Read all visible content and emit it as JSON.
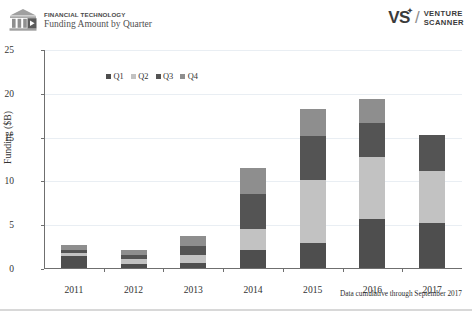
{
  "header": {
    "brand_title": "FINANCIAL TECHNOLOGY",
    "brand_subtitle": "Funding Amount by Quarter",
    "logo_left_icon": "bank-building-icon",
    "logo_right_mark": "VS",
    "logo_right_star": "✦",
    "logo_right_slash": "/",
    "logo_right_line1": "VENTURE",
    "logo_right_line2": "SCANNER"
  },
  "footnote": "Data cumulative through September 2017",
  "colors": {
    "q1": "#4e4e4e",
    "q2": "#c2c2c2",
    "q3": "#545454",
    "q4": "#8e8e8e",
    "axis": "#6f6f6f",
    "grid": "#e9eef3",
    "text": "#333333"
  },
  "chart_data": {
    "type": "bar",
    "stacked": true,
    "title": "Funding Amount by Quarter",
    "subtitle": "FINANCIAL TECHNOLOGY",
    "xlabel": "",
    "ylabel": "Funding ($B)",
    "ylim": [
      0,
      25
    ],
    "yticks": [
      0,
      5,
      10,
      15,
      20,
      25
    ],
    "grid": true,
    "legend_position": "top-left",
    "categories": [
      "2011",
      "2012",
      "2013",
      "2014",
      "2015",
      "2016",
      "2017"
    ],
    "series": [
      {
        "name": "Q1",
        "color": "#4e4e4e",
        "values": [
          1.4,
          0.5,
          0.6,
          2.0,
          2.8,
          5.6,
          5.1
        ]
      },
      {
        "name": "Q2",
        "color": "#c2c2c2",
        "values": [
          0.3,
          0.5,
          0.9,
          2.5,
          7.2,
          7.1,
          6.0
        ]
      },
      {
        "name": "Q3",
        "color": "#545454",
        "values": [
          0.4,
          0.5,
          1.0,
          4.0,
          5.1,
          3.8,
          4.1
        ]
      },
      {
        "name": "Q4",
        "color": "#8e8e8e",
        "values": [
          0.5,
          0.6,
          1.2,
          2.9,
          3.0,
          2.8,
          0.0
        ]
      }
    ],
    "totals": [
      2.6,
      2.1,
      3.7,
      11.4,
      18.1,
      19.3,
      15.2
    ]
  }
}
